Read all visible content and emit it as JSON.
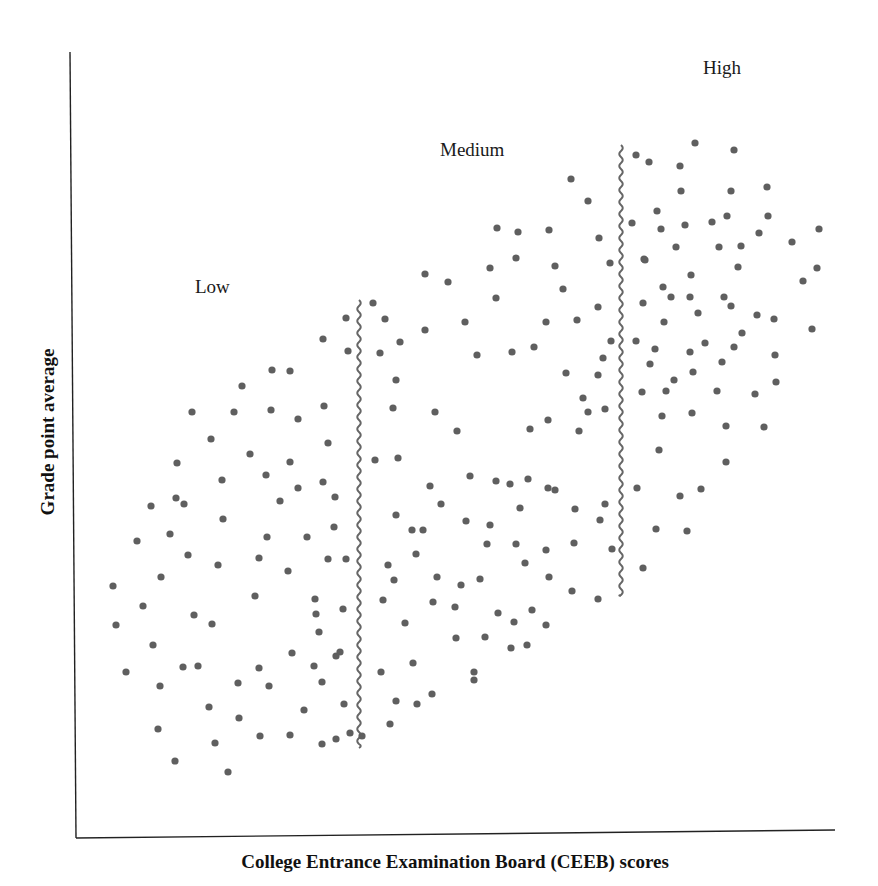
{
  "chart_data": {
    "type": "scatter",
    "title": "",
    "xlabel": "College Entrance Examination Board (CEEB) scores",
    "ylabel": "Grade point average",
    "grid": false,
    "ticks": false,
    "legend": null,
    "colors": {
      "dot": "#5f5f5f",
      "axis": "#222222",
      "divider": "#666666",
      "text": "#1a1a1a"
    },
    "plot_area_px": {
      "left": 70,
      "top": 50,
      "right": 835,
      "bottom": 835
    },
    "annotations": [
      {
        "text": "Low",
        "x": 195,
        "y": 293
      },
      {
        "text": "Medium",
        "x": 440,
        "y": 156
      },
      {
        "text": "High",
        "x": 703,
        "y": 74
      }
    ],
    "dividers": [
      {
        "name": "low-medium-boundary",
        "x": 359,
        "y_top": 300,
        "y_bottom": 748
      },
      {
        "name": "medium-high-boundary",
        "x": 621,
        "y_top": 145,
        "y_bottom": 596
      }
    ],
    "series": [
      {
        "name": "Low",
        "points": [
          [
            346,
            318
          ],
          [
            323,
            339
          ],
          [
            348,
            351
          ],
          [
            272,
            370
          ],
          [
            290,
            371
          ],
          [
            242,
            386
          ],
          [
            192,
            412
          ],
          [
            234,
            412
          ],
          [
            271,
            410
          ],
          [
            298,
            419
          ],
          [
            324,
            406
          ],
          [
            211,
            439
          ],
          [
            328,
            443
          ],
          [
            250,
            454
          ],
          [
            290,
            462
          ],
          [
            177,
            463
          ],
          [
            222,
            480
          ],
          [
            266,
            475
          ],
          [
            298,
            488
          ],
          [
            323,
            482
          ],
          [
            151,
            506
          ],
          [
            176,
            498
          ],
          [
            184,
            504
          ],
          [
            280,
            501
          ],
          [
            335,
            497
          ],
          [
            223,
            519
          ],
          [
            334,
            527
          ],
          [
            137,
            541
          ],
          [
            170,
            534
          ],
          [
            267,
            537
          ],
          [
            307,
            537
          ],
          [
            188,
            555
          ],
          [
            218,
            565
          ],
          [
            259,
            558
          ],
          [
            328,
            559
          ],
          [
            346,
            559
          ],
          [
            161,
            577
          ],
          [
            288,
            571
          ],
          [
            113,
            586
          ],
          [
            255,
            596
          ],
          [
            315,
            599
          ],
          [
            343,
            609
          ],
          [
            143,
            606
          ],
          [
            194,
            615
          ],
          [
            212,
            624
          ],
          [
            116,
            625
          ],
          [
            316,
            614
          ],
          [
            319,
            632
          ],
          [
            153,
            645
          ],
          [
            183,
            667
          ],
          [
            198,
            666
          ],
          [
            126,
            672
          ],
          [
            259,
            668
          ],
          [
            292,
            653
          ],
          [
            314,
            666
          ],
          [
            336,
            656
          ],
          [
            340,
            652
          ],
          [
            322,
            682
          ],
          [
            160,
            686
          ],
          [
            238,
            683
          ],
          [
            269,
            686
          ],
          [
            209,
            707
          ],
          [
            344,
            704
          ],
          [
            304,
            710
          ],
          [
            239,
            718
          ],
          [
            158,
            729
          ],
          [
            215,
            743
          ],
          [
            260,
            736
          ],
          [
            290,
            735
          ],
          [
            322,
            744
          ],
          [
            336,
            739
          ],
          [
            350,
            733
          ],
          [
            175,
            761
          ],
          [
            228,
            772
          ]
        ]
      },
      {
        "name": "Medium",
        "points": [
          [
            373,
            303
          ],
          [
            385,
            319
          ],
          [
            400,
            342
          ],
          [
            380,
            353
          ],
          [
            425,
            330
          ],
          [
            396,
            380
          ],
          [
            393,
            408
          ],
          [
            375,
            460
          ],
          [
            398,
            458
          ],
          [
            435,
            412
          ],
          [
            457,
            431
          ],
          [
            477,
            355
          ],
          [
            512,
            352
          ],
          [
            534,
            347
          ],
          [
            566,
            373
          ],
          [
            598,
            375
          ],
          [
            603,
            358
          ],
          [
            611,
            341
          ],
          [
            588,
            412
          ],
          [
            605,
            409
          ],
          [
            571,
            179
          ],
          [
            588,
            201
          ],
          [
            549,
            230
          ],
          [
            599,
            238
          ],
          [
            610,
            263
          ],
          [
            555,
            266
          ],
          [
            425,
            274
          ],
          [
            448,
            282
          ],
          [
            497,
            228
          ],
          [
            518,
            232
          ],
          [
            490,
            268
          ],
          [
            516,
            258
          ],
          [
            465,
            322
          ],
          [
            496,
            298
          ],
          [
            546,
            322
          ],
          [
            577,
            320
          ],
          [
            563,
            289
          ],
          [
            598,
            307
          ],
          [
            530,
            429
          ],
          [
            548,
            420
          ],
          [
            583,
            398
          ],
          [
            579,
            431
          ],
          [
            510,
            484
          ],
          [
            528,
            479
          ],
          [
            548,
            488
          ],
          [
            423,
            530
          ],
          [
            441,
            504
          ],
          [
            470,
            476
          ],
          [
            496,
            481
          ],
          [
            396,
            515
          ],
          [
            412,
            530
          ],
          [
            430,
            486
          ],
          [
            520,
            508
          ],
          [
            555,
            490
          ],
          [
            575,
            509
          ],
          [
            600,
            520
          ],
          [
            605,
            504
          ],
          [
            466,
            521
          ],
          [
            490,
            525
          ],
          [
            487,
            544
          ],
          [
            516,
            544
          ],
          [
            546,
            550
          ],
          [
            416,
            554
          ],
          [
            394,
            580
          ],
          [
            437,
            577
          ],
          [
            461,
            585
          ],
          [
            480,
            579
          ],
          [
            574,
            543
          ],
          [
            525,
            563
          ],
          [
            612,
            549
          ],
          [
            388,
            565
          ],
          [
            549,
            577
          ],
          [
            572,
            591
          ],
          [
            598,
            599
          ],
          [
            383,
            600
          ],
          [
            433,
            602
          ],
          [
            455,
            607
          ],
          [
            498,
            613
          ],
          [
            532,
            610
          ],
          [
            546,
            625
          ],
          [
            405,
            623
          ],
          [
            456,
            638
          ],
          [
            485,
            637
          ],
          [
            514,
            622
          ],
          [
            527,
            645
          ],
          [
            511,
            648
          ],
          [
            413,
            663
          ],
          [
            474,
            672
          ],
          [
            381,
            672
          ],
          [
            396,
            701
          ],
          [
            417,
            704
          ],
          [
            432,
            694
          ],
          [
            390,
            724
          ],
          [
            362,
            736
          ],
          [
            474,
            680
          ]
        ]
      },
      {
        "name": "High",
        "points": [
          [
            636,
            155
          ],
          [
            649,
            162
          ],
          [
            680,
            166
          ],
          [
            695,
            143
          ],
          [
            734,
            150
          ],
          [
            681,
            191
          ],
          [
            731,
            191
          ],
          [
            767,
            187
          ],
          [
            657,
            211
          ],
          [
            632,
            223
          ],
          [
            661,
            229
          ],
          [
            685,
            225
          ],
          [
            712,
            222
          ],
          [
            727,
            216
          ],
          [
            768,
            216
          ],
          [
            676,
            247
          ],
          [
            644,
            259
          ],
          [
            645,
            260
          ],
          [
            719,
            247
          ],
          [
            741,
            246
          ],
          [
            759,
            233
          ],
          [
            792,
            242
          ],
          [
            819,
            229
          ],
          [
            817,
            268
          ],
          [
            663,
            287
          ],
          [
            691,
            275
          ],
          [
            738,
            267
          ],
          [
            803,
            281
          ],
          [
            671,
            297
          ],
          [
            690,
            297
          ],
          [
            724,
            297
          ],
          [
            731,
            306
          ],
          [
            643,
            303
          ],
          [
            664,
            322
          ],
          [
            698,
            313
          ],
          [
            757,
            315
          ],
          [
            774,
            319
          ],
          [
            812,
            329
          ],
          [
            636,
            341
          ],
          [
            655,
            349
          ],
          [
            690,
            352
          ],
          [
            734,
            347
          ],
          [
            742,
            333
          ],
          [
            705,
            343
          ],
          [
            650,
            364
          ],
          [
            674,
            380
          ],
          [
            722,
            362
          ],
          [
            693,
            372
          ],
          [
            642,
            392
          ],
          [
            666,
            391
          ],
          [
            717,
            391
          ],
          [
            662,
            416
          ],
          [
            692,
            413
          ],
          [
            726,
            426
          ],
          [
            764,
            427
          ],
          [
            755,
            394
          ],
          [
            776,
            382
          ],
          [
            775,
            355
          ],
          [
            659,
            450
          ],
          [
            726,
            462
          ],
          [
            637,
            488
          ],
          [
            680,
            496
          ],
          [
            701,
            489
          ],
          [
            656,
            529
          ],
          [
            687,
            531
          ],
          [
            643,
            568
          ]
        ]
      }
    ]
  },
  "labels": {
    "low": "Low",
    "medium": "Medium",
    "high": "High",
    "x_axis_title": "College Entrance Examination Board (CEEB) scores",
    "y_axis_title": "Grade point average"
  }
}
